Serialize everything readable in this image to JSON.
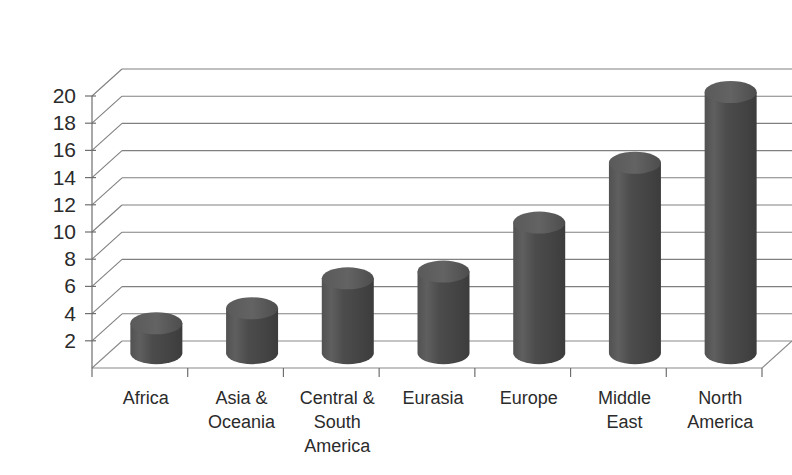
{
  "chart_data": {
    "type": "bar",
    "subtype": "3d-cylinder-column",
    "title": "",
    "subtitle": "",
    "xlabel": "",
    "ylabel": "",
    "categories": [
      "Africa",
      "Asia &\nOceania",
      "Central &\nSouth\nAmerica",
      "Eurasia",
      "Europe",
      "Middle\nEast",
      "North\nAmerica"
    ],
    "category_lines": [
      [
        "Africa"
      ],
      [
        "Asia &",
        "Oceania"
      ],
      [
        "Central &",
        "South",
        "America"
      ],
      [
        "Eurasia"
      ],
      [
        "Europe"
      ],
      [
        "Middle",
        "East"
      ],
      [
        "North",
        "America"
      ]
    ],
    "values": [
      2.2,
      3.3,
      5.5,
      6.0,
      9.6,
      14.0,
      19.2
    ],
    "ylim": [
      0,
      20
    ],
    "ytick_values": [
      2,
      4,
      6,
      8,
      10,
      12,
      14,
      16,
      18,
      20
    ],
    "ytick_labels": [
      "2",
      "4",
      "6",
      "8",
      "10",
      "12",
      "14",
      "16",
      "18",
      "20"
    ],
    "ytick_step": 2,
    "grid": true,
    "grid_axis": "y",
    "legend": false,
    "legend_position": "none",
    "series": [
      {
        "name": "",
        "values": [
          2.2,
          3.3,
          5.5,
          6.0,
          9.6,
          14.0,
          19.2
        ]
      }
    ]
  },
  "style": {
    "background_color": "#ffffff",
    "bar_color": "#4a4a4a",
    "bar_color_light": "#6b6b6b",
    "bar_color_dark": "#3a3a3a",
    "bar_top_color": "#565656",
    "gridline_color": "#808080",
    "axis_color": "#6e6e6e",
    "text_color": "#2b2b2b"
  }
}
